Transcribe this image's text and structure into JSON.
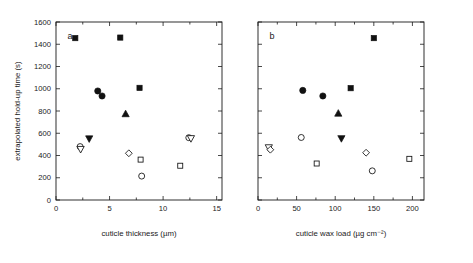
{
  "figure": {
    "width": 473,
    "height": 263,
    "background": "#ffffff",
    "foreground": "#1a1a1a",
    "shared_ylabel": "extrapolated hold-up time (s)"
  },
  "chart_data": [
    {
      "type": "scatter",
      "panel": "a",
      "panel_label": "a",
      "title": "",
      "xlabel": "cuticle thickness (µm)",
      "ylabel": "extrapolated hold-up time (s)",
      "xlim": [
        0,
        15.5
      ],
      "ylim": [
        0,
        1600
      ],
      "xticks": [
        0,
        5,
        10,
        15
      ],
      "xticklabels": [
        "0",
        "5",
        "10",
        "15"
      ],
      "xminorticks": [
        2.5,
        7.5,
        12.5
      ],
      "yticks": [
        0,
        200,
        400,
        600,
        800,
        1000,
        1200,
        1400,
        1600
      ],
      "yticklabels": [
        "0",
        "200",
        "400",
        "600",
        "800",
        "1000",
        "1200",
        "1400",
        "1600"
      ],
      "grid": false,
      "legend": "none",
      "points": [
        {
          "x": 1.8,
          "y": 1455,
          "marker": "square",
          "fill": "filled"
        },
        {
          "x": 6.0,
          "y": 1460,
          "marker": "square",
          "fill": "filled"
        },
        {
          "x": 3.9,
          "y": 980,
          "marker": "circle",
          "fill": "filled"
        },
        {
          "x": 4.3,
          "y": 935,
          "marker": "circle",
          "fill": "filled"
        },
        {
          "x": 7.8,
          "y": 1008,
          "marker": "square",
          "fill": "filled"
        },
        {
          "x": 6.5,
          "y": 775,
          "marker": "triangle-up",
          "fill": "filled"
        },
        {
          "x": 3.1,
          "y": 550,
          "marker": "triangle-down",
          "fill": "filled"
        },
        {
          "x": 2.25,
          "y": 480,
          "marker": "circle",
          "fill": "open"
        },
        {
          "x": 2.3,
          "y": 455,
          "marker": "triangle-down",
          "fill": "open"
        },
        {
          "x": 12.4,
          "y": 560,
          "marker": "circle",
          "fill": "open"
        },
        {
          "x": 12.6,
          "y": 552,
          "marker": "triangle-down",
          "fill": "open"
        },
        {
          "x": 6.8,
          "y": 420,
          "marker": "diamond",
          "fill": "open"
        },
        {
          "x": 7.9,
          "y": 363,
          "marker": "square",
          "fill": "open"
        },
        {
          "x": 11.6,
          "y": 308,
          "marker": "square",
          "fill": "open"
        },
        {
          "x": 8.0,
          "y": 215,
          "marker": "circle",
          "fill": "open"
        }
      ]
    },
    {
      "type": "scatter",
      "panel": "b",
      "panel_label": "b",
      "title": "",
      "xlabel": "cuticle wax load (µg cm⁻²)",
      "ylabel": "extrapolated hold-up time (s)",
      "xlim": [
        0,
        215
      ],
      "ylim": [
        0,
        1600
      ],
      "xticks": [
        0,
        50,
        100,
        150,
        200
      ],
      "xticklabels": [
        "0",
        "50",
        "100",
        "150",
        "200"
      ],
      "xminorticks": [
        25,
        75,
        125,
        175
      ],
      "yticks": [
        0,
        200,
        400,
        600,
        800,
        1000,
        1200,
        1400,
        1600
      ],
      "yticklabels": [
        "0",
        "200",
        "400",
        "600",
        "800",
        "1000",
        "1200",
        "1400",
        "1600"
      ],
      "grid": false,
      "legend": "none",
      "points": [
        {
          "x": 150,
          "y": 1455,
          "marker": "square",
          "fill": "filled"
        },
        {
          "x": 58,
          "y": 985,
          "marker": "circle",
          "fill": "filled"
        },
        {
          "x": 84,
          "y": 935,
          "marker": "circle",
          "fill": "filled"
        },
        {
          "x": 120,
          "y": 1005,
          "marker": "square",
          "fill": "filled"
        },
        {
          "x": 104,
          "y": 780,
          "marker": "triangle-up",
          "fill": "filled"
        },
        {
          "x": 108,
          "y": 552,
          "marker": "triangle-down",
          "fill": "filled"
        },
        {
          "x": 56,
          "y": 562,
          "marker": "circle",
          "fill": "open"
        },
        {
          "x": 14,
          "y": 470,
          "marker": "triangle-down",
          "fill": "open"
        },
        {
          "x": 16,
          "y": 452,
          "marker": "diamond",
          "fill": "open"
        },
        {
          "x": 140,
          "y": 425,
          "marker": "diamond",
          "fill": "open"
        },
        {
          "x": 196,
          "y": 370,
          "marker": "square",
          "fill": "open"
        },
        {
          "x": 76,
          "y": 328,
          "marker": "square",
          "fill": "open"
        },
        {
          "x": 148,
          "y": 262,
          "marker": "circle",
          "fill": "open"
        }
      ]
    }
  ]
}
